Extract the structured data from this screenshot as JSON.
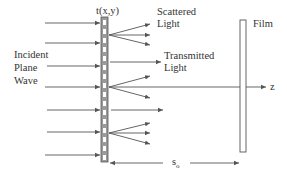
{
  "labels": {
    "transmittance": "t(x,y)",
    "scattered_line1": "Scattered",
    "scattered_line2": "Light",
    "transmitted_line1": "Transmitted",
    "transmitted_line2": "Light",
    "incident_line1": "Incident",
    "incident_line2": "Plane",
    "incident_line3": "Wave",
    "film": "Film",
    "axis": "z",
    "distance": "s",
    "distance_sub": "o"
  },
  "colors": {
    "line": "#555555",
    "grating_fill": "#9a9a9a",
    "grating_cell": "#ffffff",
    "text": "#333333"
  }
}
